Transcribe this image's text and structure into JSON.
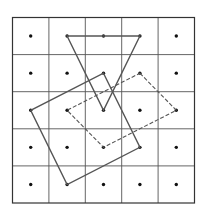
{
  "figure": {
    "grid": {
      "rows": 5,
      "cols": 5,
      "origin": [
        12.5,
        17.5
      ],
      "cell_width": 36.4,
      "cell_height": 37.1,
      "line_color": "#555555"
    },
    "dots": {
      "description": "one dot at the center of each grid cell",
      "color": "#111111"
    },
    "shapes": [
      {
        "name": "inverted-triangle",
        "style": "solid",
        "vertices_cell": [
          [
            1,
            0
          ],
          [
            3,
            0
          ],
          [
            2,
            2
          ]
        ]
      },
      {
        "name": "tilted-square-solid",
        "style": "solid",
        "vertices_cell": [
          [
            2,
            1
          ],
          [
            3,
            3
          ],
          [
            1,
            4
          ],
          [
            0,
            2
          ]
        ]
      },
      {
        "name": "tilted-square-dashed",
        "style": "dashed",
        "vertices_cell": [
          [
            3,
            1
          ],
          [
            4,
            2
          ],
          [
            2,
            3
          ],
          [
            1,
            2
          ]
        ]
      }
    ]
  }
}
